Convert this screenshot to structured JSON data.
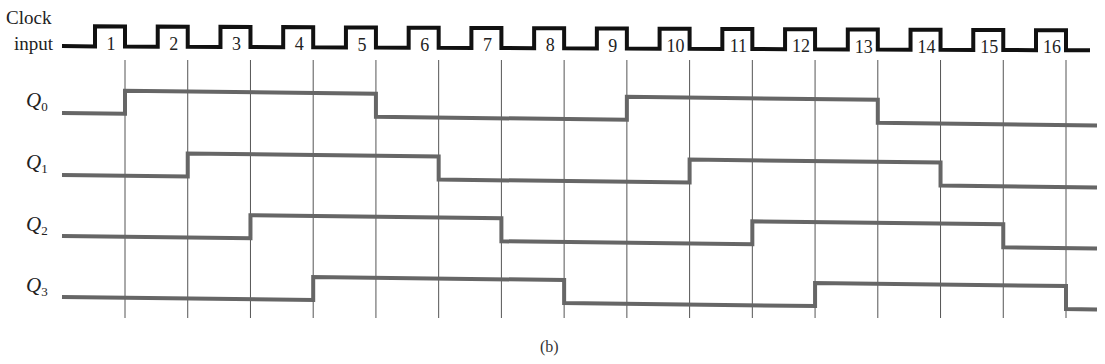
{
  "figure": {
    "clock_label_line1": "Clock",
    "clock_label_line2": "input",
    "caption": "(b)",
    "signals": [
      {
        "name": "Q",
        "sub": "0"
      },
      {
        "name": "Q",
        "sub": "1"
      },
      {
        "name": "Q",
        "sub": "2"
      },
      {
        "name": "Q",
        "sub": "3"
      }
    ],
    "clock_pulse_labels": [
      "1",
      "2",
      "3",
      "4",
      "5",
      "6",
      "7",
      "8",
      "9",
      "10",
      "11",
      "12",
      "13",
      "14",
      "15",
      "16"
    ],
    "colors": {
      "clock": "#111111",
      "signal": "#666666",
      "gridline": "#555555"
    }
  },
  "chart_data": {
    "type": "timing-diagram",
    "title": "",
    "caption": "(b)",
    "clock": {
      "label": "Clock input",
      "pulses": 16,
      "trigger": "falling-edge"
    },
    "signals": [
      {
        "name": "Q0",
        "initial": 0,
        "transitions_at_clock": [
          1,
          5,
          9,
          13
        ],
        "values_after_each_clock": [
          1,
          1,
          1,
          1,
          0,
          0,
          0,
          0,
          1,
          1,
          1,
          1,
          0,
          0,
          0,
          0
        ]
      },
      {
        "name": "Q1",
        "initial": 0,
        "transitions_at_clock": [
          2,
          6,
          10,
          14
        ],
        "values_after_each_clock": [
          0,
          1,
          1,
          1,
          1,
          0,
          0,
          0,
          0,
          1,
          1,
          1,
          1,
          0,
          0,
          0
        ]
      },
      {
        "name": "Q2",
        "initial": 0,
        "transitions_at_clock": [
          3,
          7,
          11,
          15
        ],
        "values_after_each_clock": [
          0,
          0,
          1,
          1,
          1,
          1,
          0,
          0,
          0,
          0,
          1,
          1,
          1,
          1,
          0,
          0
        ]
      },
      {
        "name": "Q3",
        "initial": 0,
        "transitions_at_clock": [
          4,
          8,
          12,
          16
        ],
        "values_after_each_clock": [
          0,
          0,
          0,
          1,
          1,
          1,
          1,
          0,
          0,
          0,
          0,
          1,
          1,
          1,
          1,
          0
        ]
      }
    ]
  }
}
